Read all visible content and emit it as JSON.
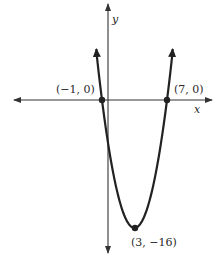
{
  "chart_data": {
    "type": "line",
    "title": "",
    "function": "y = (x + 1)(x - 7) = x^2 - 6x - 7",
    "xlabel": "x",
    "ylabel": "y",
    "grid": false,
    "legend": null,
    "xlim": [
      -4.5,
      9.2
    ],
    "ylim": [
      -17.5,
      10.5
    ],
    "points": [
      {
        "x": -1,
        "y": 0,
        "label": "(−1, 0)"
      },
      {
        "x": 7,
        "y": 0,
        "label": "(7, 0)"
      },
      {
        "x": 3,
        "y": -16,
        "label": "(3, −16)"
      }
    ],
    "annotations": [
      "(−1, 0)",
      "(7, 0)",
      "(3, −16)"
    ],
    "curve_ends_arrows": true,
    "colors": {
      "curve": "#222222",
      "axes": "#333333",
      "text": "#2a2a2a"
    }
  },
  "labels": {
    "x_axis": "x",
    "y_axis": "y",
    "left_root": "(−1, 0)",
    "right_root": "(7, 0)",
    "vertex": "(3, −16)"
  }
}
